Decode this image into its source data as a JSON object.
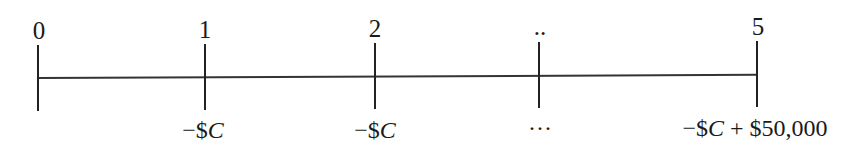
{
  "timeline": {
    "periods": [
      {
        "label": "0",
        "x": 38,
        "cashflow_prefix": "",
        "cashflow_var": "",
        "cashflow_suffix": ""
      },
      {
        "label": "1",
        "x": 205,
        "cashflow_prefix": "−$",
        "cashflow_var": "C",
        "cashflow_suffix": ""
      },
      {
        "label": "2",
        "x": 375,
        "cashflow_prefix": "−$",
        "cashflow_var": "C",
        "cashflow_suffix": ""
      },
      {
        "label": "..",
        "x": 539,
        "cashflow_prefix": "···",
        "cashflow_var": "",
        "cashflow_suffix": ""
      },
      {
        "label": "5",
        "x": 757,
        "cashflow_prefix": "−$",
        "cashflow_var": "C",
        "cashflow_suffix": " + $50,000"
      }
    ]
  }
}
